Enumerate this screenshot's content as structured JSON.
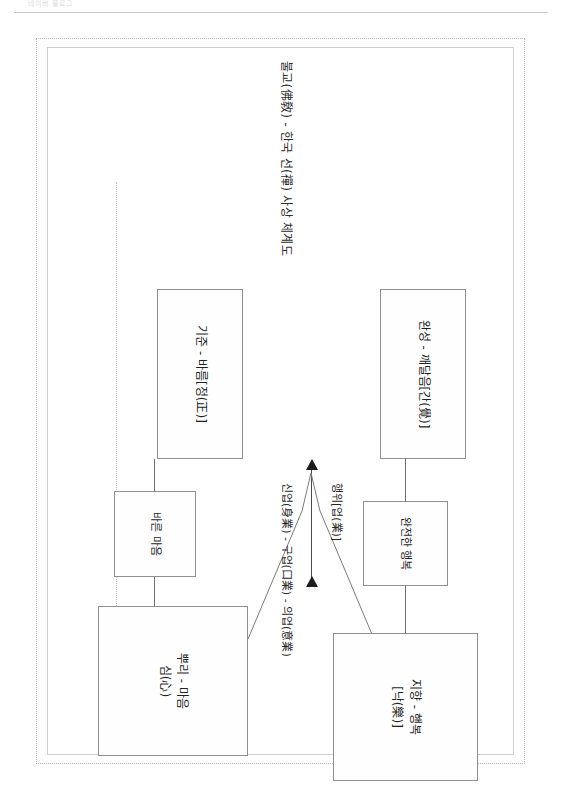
{
  "header": {
    "watermark": "네이버 블로그"
  },
  "document": {
    "title": "불교(佛敎) - 한국 선(禪) 사상 체계도"
  },
  "diagram": {
    "type": "flow-diagram",
    "orientation": "rotated-90-clockwise",
    "boxes": [
      {
        "id": "perfect-happiness",
        "label": "완전한 행복"
      },
      {
        "id": "aim-happiness",
        "label_line1": "지향 - 행복",
        "label_line2": "[낙(樂)]"
      },
      {
        "id": "completion",
        "label": "완성 - 깨달음[간(覺)]"
      },
      {
        "id": "standard",
        "label": "기준 - 바름[정(正)]"
      },
      {
        "id": "root-mind",
        "label_line1": "뿌리 - 마음",
        "label_line2": "심(心)"
      },
      {
        "id": "right-mind",
        "label": "바른 마음"
      }
    ],
    "labels": {
      "action": "행위[업(業)]",
      "three_karmas": "신업(身業) - 구업(口業) - 의업(意業)"
    }
  },
  "colors": {
    "box_border": "#8f8f8f",
    "line": "#6e6e6e",
    "arrow": "#1c1c1c",
    "sheet_border": "#b8b8b8",
    "text": "#1f1f1f"
  }
}
